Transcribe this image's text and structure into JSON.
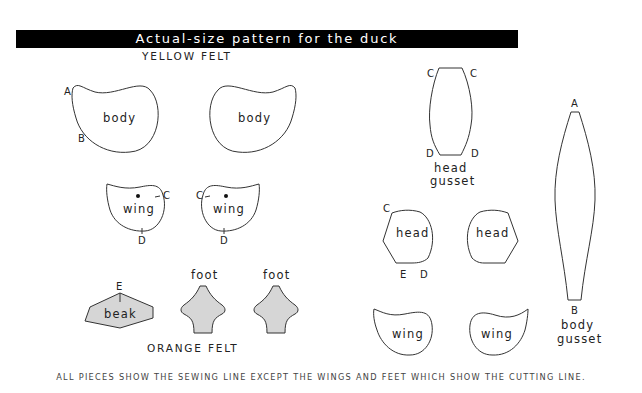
{
  "title": "Actual-size pattern for the duck",
  "sections": {
    "yellow_felt": "YELLOW FELT",
    "orange_felt": "ORANGE FELT"
  },
  "pieces": {
    "body_left": "body",
    "body_right": "body",
    "wing_small_left": "wing",
    "wing_small_right": "wing",
    "beak": "beak",
    "foot_left": "foot",
    "foot_right": "foot",
    "head_gusset_line1": "head",
    "head_gusset_line2": "gusset",
    "head_left": "head",
    "head_right": "head",
    "wing_large_left": "wing",
    "wing_large_right": "wing",
    "body_gusset_line1": "body",
    "body_gusset_line2": "gusset"
  },
  "points": {
    "body_a": "A",
    "body_b": "B",
    "wing_left_c": "C",
    "wing_left_d": "D",
    "wing_right_c": "C",
    "wing_right_d": "D",
    "beak_e": "E",
    "head_gusset_c_left": "C",
    "head_gusset_c_right": "C",
    "head_gusset_d_left": "D",
    "head_gusset_d_right": "D",
    "head_c": "C",
    "head_e": "E",
    "head_d": "D",
    "body_gusset_a": "A",
    "body_gusset_b": "B"
  },
  "footer": "ALL PIECES SHOW THE SEWING LINE EXCEPT THE WINGS AND FEET WHICH SHOW THE CUTTING LINE.",
  "colors": {
    "title_bg": "#000000",
    "title_text": "#ffffff",
    "outline": "#333333",
    "orange_fill": "#d6d6d6"
  }
}
